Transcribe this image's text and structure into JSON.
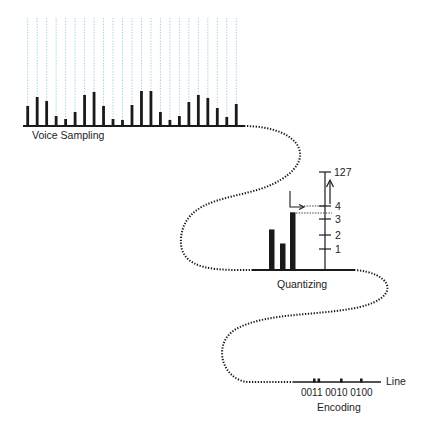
{
  "colors": {
    "ink": "#1a1a1a",
    "grid": "#8cc6dc"
  },
  "voice_sampling": {
    "label": "Voice Sampling",
    "sample_count": 23,
    "sample_levels": [
      20,
      29,
      25,
      10,
      7,
      14,
      31,
      34,
      20,
      7,
      6,
      21,
      35,
      35,
      14,
      6,
      10,
      24,
      31,
      28,
      18,
      9,
      22
    ]
  },
  "quantizing": {
    "label": "Quantizing",
    "bar_levels": [
      2.6,
      1.7,
      3.7
    ],
    "scale_ticks": [
      {
        "value": 1,
        "label": "1"
      },
      {
        "value": 2,
        "label": "2"
      },
      {
        "value": 3,
        "label": "3"
      },
      {
        "value": 4,
        "label": "4"
      }
    ],
    "max_label": "127"
  },
  "encoding": {
    "label": "Encoding",
    "codes": "0011 0010 0100",
    "line_label": "Line"
  }
}
